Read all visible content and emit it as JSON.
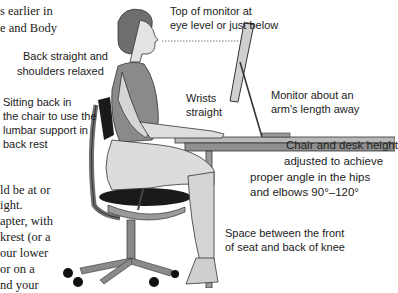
{
  "body_text_fragments": {
    "top": [
      "s earlier in",
      "e and Body"
    ],
    "bottom": [
      "ld be at or",
      "ight.",
      "apter, with",
      "krest (or a",
      "our lower",
      " or on a",
      "nd your"
    ]
  },
  "labels": {
    "top_of_monitor": [
      "Top of monitor at",
      "eye level or just below"
    ],
    "back_straight": [
      "Back straight and",
      "shoulders relaxed"
    ],
    "sitting_back": [
      "Sitting back in",
      "the chair to use the",
      "lumbar support in",
      "back rest"
    ],
    "wrists": [
      "Wrists",
      "straight"
    ],
    "monitor_distance": [
      "Monitor about an",
      "arm's length away"
    ],
    "chair_desk_height": [
      "Chair and desk height",
      "adjusted to achieve",
      "proper angle in the hips",
      "and elbows 90°–120°"
    ],
    "knee_space": [
      "Space between the front",
      "of seat and back of knee"
    ]
  },
  "colors": {
    "text": "#222222",
    "skin": "#d9d9d9",
    "shirt": "#8a8a8a",
    "pants": "#d6d6d6",
    "chair_dark": "#1a1a1a",
    "chair_frame": "#7a7a7a",
    "desk": "#9a9a9a"
  }
}
